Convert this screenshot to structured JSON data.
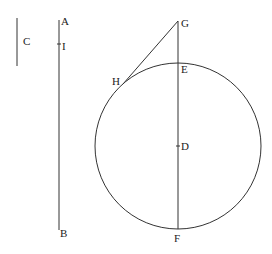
{
  "diagram": {
    "type": "geometric-figure",
    "labels": {
      "A": "A",
      "B": "B",
      "C": "C",
      "I": "I",
      "G": "G",
      "H": "H",
      "E": "E",
      "D": "D",
      "F": "F"
    },
    "elements": [
      {
        "kind": "segment",
        "name": "C",
        "from": [
          17,
          18
        ],
        "to": [
          17,
          66
        ]
      },
      {
        "kind": "segment",
        "name": "AB",
        "from": [
          59,
          20
        ],
        "to": [
          59,
          230
        ]
      },
      {
        "kind": "point",
        "name": "I",
        "on": "AB",
        "at": [
          59,
          44
        ]
      },
      {
        "kind": "circle",
        "center": "D",
        "cx": 178,
        "cy": 146,
        "r": 83
      },
      {
        "kind": "segment",
        "name": "GF",
        "from": [
          178,
          21
        ],
        "to": [
          178,
          229
        ]
      },
      {
        "kind": "segment",
        "name": "GH",
        "from": [
          178,
          21
        ],
        "to": [
          123,
          84
        ],
        "note": "tangent to circle at H"
      }
    ]
  }
}
